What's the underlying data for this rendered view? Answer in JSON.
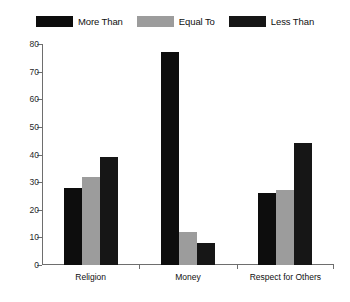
{
  "chart_data": {
    "type": "bar",
    "title": "",
    "subtitle": "",
    "xlabel": "",
    "ylabel": "",
    "categories": [
      "Religion",
      "Money",
      "Respect for Others"
    ],
    "series": [
      {
        "name": "More Than",
        "color": "#0d0d0d",
        "values": [
          28,
          77,
          26
        ]
      },
      {
        "name": "Equal To",
        "color": "#9c9c9c",
        "values": [
          32,
          12,
          27
        ]
      },
      {
        "name": "Less Than",
        "color": "#161616",
        "values": [
          39,
          8,
          44
        ]
      }
    ],
    "ylim": [
      0,
      80
    ],
    "yticks": [
      0,
      10,
      20,
      30,
      40,
      50,
      60,
      70,
      80
    ],
    "ytick_labels": [
      "0",
      "10",
      "20",
      "30",
      "40",
      "50",
      "60",
      "70",
      "80"
    ],
    "grid": false,
    "legend_position": "top",
    "axis_color": "#6e6e6e",
    "background_color": "#ffffff"
  },
  "legend": {
    "entries": [
      {
        "label": "More Than"
      },
      {
        "label": "Equal To"
      },
      {
        "label": "Less Than"
      }
    ]
  }
}
